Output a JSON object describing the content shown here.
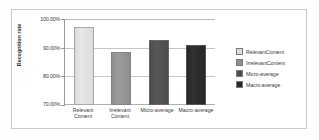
{
  "chart_data": {
    "type": "bar",
    "title": "",
    "xlabel": "",
    "ylabel": "Recognition  rate",
    "categories": [
      "Relevant\nContent",
      "Irrelevant\nContent",
      "Micro-average",
      "Macro-average"
    ],
    "values": [
      97.2,
      88.5,
      92.7,
      90.9
    ],
    "ylim": [
      70.0,
      100.0
    ],
    "yticks": [
      70.0,
      80.0,
      90.0,
      100.0
    ],
    "ytick_labels": [
      "70.00%",
      "80.00%",
      "90.00%",
      "100.00%"
    ],
    "grid": true,
    "legend_position": "right",
    "series_colors": [
      "#dcdcdc",
      "#8f8f8f",
      "#4c4c4c",
      "#262626"
    ],
    "legend": [
      {
        "label": "RelevantContent",
        "color": "#dcdcdc"
      },
      {
        "label": "IrrelevantContent",
        "color": "#8f8f8f"
      },
      {
        "label": "Micro-average",
        "color": "#4c4c4c"
      },
      {
        "label": "Macro-average",
        "color": "#262626"
      }
    ]
  },
  "axis": {
    "y_title": "Recognition  rate"
  },
  "frame": {
    "border_color": "#c9c9c9",
    "background": "#ffffff"
  }
}
